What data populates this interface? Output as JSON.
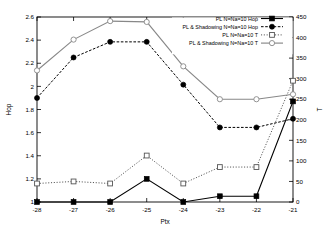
{
  "chart_data": {
    "type": "line",
    "title": "",
    "xlabel": "Ptx",
    "ylabel": "Hop",
    "y2label": "T",
    "x": [
      -28,
      -27,
      -26,
      -25,
      -24,
      -23,
      -22,
      -21
    ],
    "xlim": [
      -28,
      -21
    ],
    "ylim": [
      1,
      2.6
    ],
    "y2lim": [
      0,
      450
    ],
    "grid": false,
    "legend_position": "top-right",
    "xticks": [
      "-28",
      "-27",
      "-26",
      "-25",
      "-24",
      "-23",
      "-22",
      "-21"
    ],
    "yticks": [
      "1",
      "1.2",
      "1.4",
      "1.6",
      "1.8",
      "2",
      "2.2",
      "2.4",
      "2.6"
    ],
    "y2ticks": [
      "0",
      "50",
      "100",
      "150",
      "200",
      "250",
      "300",
      "350",
      "400",
      "450"
    ],
    "series": [
      {
        "name": "PL N=Na=10 Hop",
        "axis": "left",
        "marker": "filled-square",
        "line": "solid",
        "color": "#000000",
        "values": [
          1.0,
          1.0,
          1.0,
          1.2,
          1.0,
          1.05,
          1.05,
          1.87
        ]
      },
      {
        "name": "PL & Shadowing N=Na=10 Hop",
        "axis": "left",
        "marker": "filled-circle",
        "line": "dashed",
        "color": "#000000",
        "values": [
          1.9,
          2.25,
          2.385,
          2.385,
          2.015,
          1.645,
          1.645,
          1.72
        ]
      },
      {
        "name": "PL N=Na=10 T",
        "axis": "right",
        "marker": "open-square",
        "line": "dotted",
        "color": "#555555",
        "values": [
          45,
          50,
          45,
          113,
          45,
          85,
          85,
          295
        ]
      },
      {
        "name": "PL & Shadowing N=Na=10 T",
        "axis": "right",
        "marker": "open-circle",
        "line": "solid",
        "color": "#888888",
        "values": [
          320,
          395,
          440,
          438,
          330,
          250,
          250,
          262
        ]
      }
    ]
  }
}
